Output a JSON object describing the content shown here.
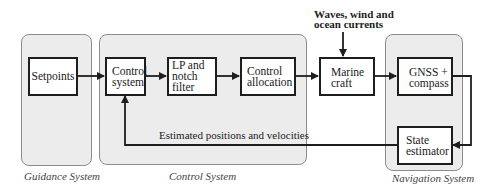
{
  "diagram": {
    "type": "block-diagram",
    "panels": [
      {
        "id": "guidance",
        "caption": "Guidance System"
      },
      {
        "id": "control",
        "caption": "Control System"
      },
      {
        "id": "navigation",
        "caption": "Navigation System"
      }
    ],
    "blocks": {
      "setpoints": "Setpoints",
      "control_system": "Control\nsystem",
      "lp_notch": "LP and\nnotch filter",
      "control_allocation": "Control\nallocation",
      "marine_craft": "Marine\ncraft",
      "gnss_compass": "GNSS +\ncompass",
      "state_estimator": "State\nestimator"
    },
    "disturbance_label": "Waves, wind and\nocean currents",
    "feedback_label": "Estimated positions and velocities",
    "edges": [
      {
        "from": "setpoints",
        "to": "control_system"
      },
      {
        "from": "control_system",
        "to": "lp_notch"
      },
      {
        "from": "lp_notch",
        "to": "control_allocation"
      },
      {
        "from": "control_allocation",
        "to": "marine_craft"
      },
      {
        "from": "disturbance",
        "to": "marine_craft"
      },
      {
        "from": "marine_craft",
        "to": "gnss_compass"
      },
      {
        "from": "gnss_compass",
        "to": "state_estimator"
      },
      {
        "from": "state_estimator",
        "to": "control_system",
        "label": "Estimated positions and velocities"
      }
    ],
    "colors": {
      "panel_fill": "#ececec",
      "panel_border": "#8c8c8c",
      "block_border": "#1e1e1e",
      "wire": "#1e1e1e"
    }
  }
}
